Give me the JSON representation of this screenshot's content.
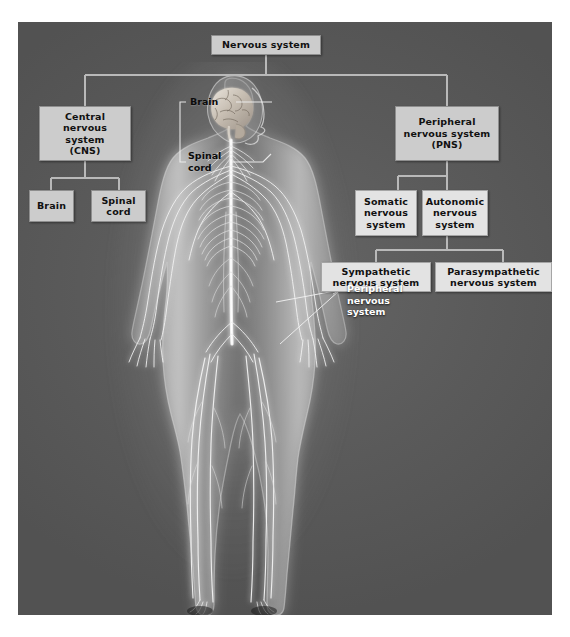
{
  "panel": {
    "background_color": "#5b5b5b",
    "box_fill_color": "#cccccc",
    "box_text_color": "#111111",
    "connector_color": "#b9b9b9",
    "callout_text_color": "#ffffff"
  },
  "diagram": {
    "title": "Nervous system",
    "root": {
      "label": "Nervous system"
    },
    "branches": [
      {
        "id": "cns",
        "label": "Central\nnervous system\n(CNS)",
        "children": [
          {
            "id": "cns-brain",
            "label": "Brain"
          },
          {
            "id": "cns-spinal-cord",
            "label": "Spinal\ncord"
          }
        ]
      },
      {
        "id": "pns",
        "label": "Peripheral\nnervous system\n(PNS)",
        "children": [
          {
            "id": "somatic",
            "label": "Somatic\nnervous\nsystem"
          },
          {
            "id": "autonomic",
            "label": "Autonomic\nnervous\nsystem",
            "children": [
              {
                "id": "sympathetic",
                "label": "Sympathetic\nnervous system"
              },
              {
                "id": "parasympathetic",
                "label": "Parasympathetic\nnervous system"
              }
            ]
          }
        ]
      }
    ]
  },
  "callouts": [
    {
      "id": "brain",
      "label": "Brain"
    },
    {
      "id": "spinal-cord",
      "label": "Spinal\ncord"
    },
    {
      "id": "peripheral-nervous-system",
      "label": "Peripheral\nnervous\nsystem"
    }
  ],
  "illustration": {
    "name": "human-nervous-system-figure",
    "description": "Anterior view of a translucent human body showing the glowing nervous system: brain, spinal cord and peripheral nerves"
  }
}
